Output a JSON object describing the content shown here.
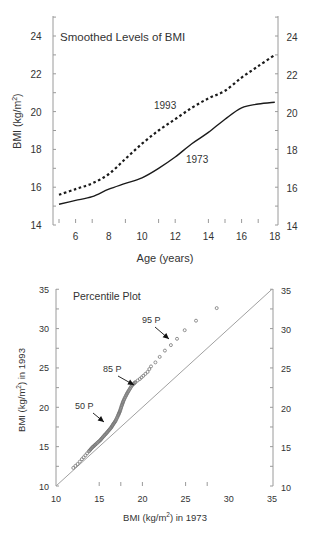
{
  "chart_data": [
    {
      "type": "line",
      "title": "Smoothed Levels of BMI",
      "xlabel": "Age (years)",
      "ylabel": "BMI (kg/m2)",
      "xlim": [
        5,
        18
      ],
      "ylim": [
        14,
        24
      ],
      "xticks": [
        6,
        8,
        10,
        12,
        14,
        16,
        18
      ],
      "yticks": [
        14,
        16,
        18,
        20,
        22,
        24
      ],
      "grid": false,
      "legend": "inline labels",
      "x": [
        5,
        6,
        7,
        8,
        9,
        10,
        11,
        12,
        13,
        14,
        15,
        16,
        17,
        18
      ],
      "series": [
        {
          "name": "1993",
          "style": "dashed",
          "values": [
            15.6,
            15.9,
            16.2,
            16.7,
            17.5,
            18.3,
            19.0,
            19.6,
            20.2,
            20.7,
            21.1,
            21.8,
            22.4,
            23.0
          ]
        },
        {
          "name": "1973",
          "style": "solid",
          "values": [
            15.1,
            15.3,
            15.5,
            15.9,
            16.2,
            16.5,
            17.0,
            17.6,
            18.3,
            18.9,
            19.6,
            20.2,
            20.4,
            20.5
          ]
        }
      ],
      "annotations": [
        {
          "text": "1993",
          "x": 12.1,
          "y": 20.4
        },
        {
          "text": "1973",
          "x": 14.1,
          "y": 17.6
        }
      ]
    },
    {
      "type": "scatter",
      "title": "Percentile Plot",
      "xlabel": "BMI (kg/m2) in 1973",
      "ylabel": "BMI (kg/m2) in 1993",
      "xlim": [
        10,
        35
      ],
      "ylim": [
        10,
        35
      ],
      "xticks": [
        10,
        15,
        20,
        25,
        30,
        35
      ],
      "yticks": [
        10,
        15,
        20,
        25,
        30,
        35
      ],
      "grid": false,
      "reference_line": {
        "from": [
          10,
          10
        ],
        "to": [
          35,
          35
        ]
      },
      "series": [
        {
          "name": "percentiles",
          "x": [
            12.0,
            12.5,
            13.0,
            13.4,
            13.8,
            14.2,
            14.6,
            15.1,
            15.5,
            15.9,
            16.3,
            16.6,
            16.9,
            17.2,
            17.4,
            17.6,
            17.8,
            18.1,
            18.4,
            18.8,
            19.2,
            19.7,
            20.1,
            20.6,
            21.0,
            21.5,
            22.0,
            22.6,
            23.3,
            24.0,
            24.9,
            26.2,
            28.6
          ],
          "y": [
            12.3,
            12.8,
            13.4,
            13.9,
            14.4,
            14.9,
            15.3,
            15.8,
            16.3,
            16.8,
            17.3,
            17.8,
            18.3,
            19.0,
            19.5,
            20.2,
            20.8,
            21.5,
            22.1,
            22.8,
            23.2,
            23.6,
            24.0,
            24.5,
            25.2,
            25.7,
            26.4,
            27.2,
            27.9,
            28.7,
            29.8,
            31.0,
            32.6
          ]
        }
      ],
      "annotations": [
        {
          "text": "50 P",
          "label_at": [
            12.3,
            22.2
          ],
          "arrow_to": [
            15.5,
            18.3
          ]
        },
        {
          "text": "85 P",
          "label_at": [
            15.8,
            26.6
          ],
          "arrow_to": [
            18.8,
            23.0
          ]
        },
        {
          "text": "95 P",
          "label_at": [
            20.2,
            32.6
          ],
          "arrow_to": [
            23.9,
            28.9
          ]
        }
      ]
    }
  ],
  "top_chart": {
    "title": "Smoothed Levels of BMI",
    "xlabel": "Age (years)",
    "ylabel_main": "BMI (kg/m",
    "ylabel_sup": "2",
    "ylabel_end": ")",
    "label_1993": "1993",
    "label_1973": "1973"
  },
  "bottom_chart": {
    "title": "Percentile Plot",
    "xlabel_main": "BMI (kg/m",
    "xlabel_sup": "2",
    "xlabel_end": ") in 1973",
    "ylabel_main": "BMI (kg/m",
    "ylabel_sup": "2",
    "ylabel_end": ") in 1993",
    "label_50": "50 P",
    "label_85": "85 P",
    "label_95": "95 P"
  },
  "colors": {
    "axis": "#9a9a9a",
    "line": "#1a1a1a",
    "marker": "#777777",
    "reference": "#9a9a9a",
    "text": "#333333"
  }
}
